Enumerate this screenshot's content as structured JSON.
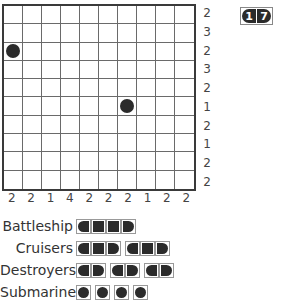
{
  "puzzle": {
    "rows": 10,
    "cols": 10,
    "row_clues": [
      "2",
      "3",
      "2",
      "3",
      "2",
      "1",
      "2",
      "1",
      "2",
      "2"
    ],
    "col_clues": [
      "2",
      "2",
      "1",
      "4",
      "2",
      "2",
      "2",
      "1",
      "2",
      "2"
    ],
    "given_cells": [
      {
        "row": 3,
        "col": 1,
        "piece": "submarine"
      },
      {
        "row": 6,
        "col": 7,
        "piece": "submarine"
      }
    ]
  },
  "counter": {
    "digits": [
      "1",
      "7"
    ]
  },
  "fleet": [
    {
      "label": "Battleship",
      "count": 1,
      "length": 4
    },
    {
      "label": "Cruisers",
      "count": 2,
      "length": 3
    },
    {
      "label": "Destroyers",
      "count": 3,
      "length": 2
    },
    {
      "label": "Submarines",
      "count": 4,
      "length": 1
    }
  ]
}
